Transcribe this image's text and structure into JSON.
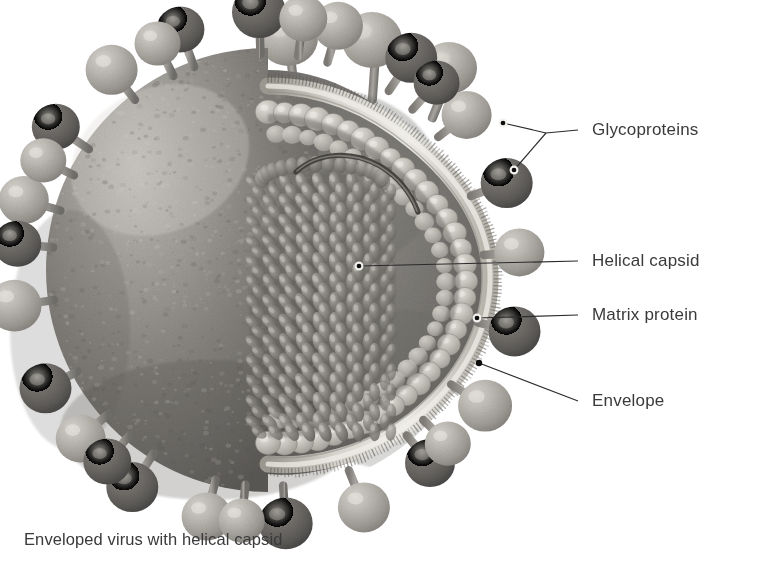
{
  "figure": {
    "kind": "scientific-illustration",
    "palette": {
      "background": "#ffffff",
      "text": "#3a3a3c",
      "leader_line": "#2b2b2d",
      "envelope_body_dark": "#6f6d6a",
      "envelope_body_mid": "#8d8a86",
      "envelope_body_light": "#b4b1ac",
      "membrane_light": "#cfccc6",
      "matrix_bead": "#c4c1bb",
      "spike_light": "#b9b6b0",
      "spike_dark": "#6a6864",
      "interior_cavity": "#7c7a76",
      "capsid_subunit": "#8a8782",
      "rna_strand": "#4d4b48"
    },
    "caption": "Enveloped virus with helical capsid",
    "labels": [
      {
        "id": "glycoproteins",
        "text": "Glycoproteins",
        "text_x": 592,
        "text_y": 135,
        "leader_type": "forked",
        "join_x": 546,
        "join_y": 133,
        "anchors": [
          {
            "x": 503,
            "y": 123,
            "style": "ring"
          },
          {
            "x": 514,
            "y": 170,
            "style": "ring"
          }
        ]
      },
      {
        "id": "helical-capsid",
        "text": "Helical capsid",
        "text_x": 592,
        "text_y": 266,
        "leader_type": "straight",
        "anchors": [
          {
            "x": 359,
            "y": 266,
            "style": "ring"
          }
        ]
      },
      {
        "id": "matrix-protein",
        "text": "Matrix protein",
        "text_x": 592,
        "text_y": 320,
        "leader_type": "straight",
        "anchors": [
          {
            "x": 477,
            "y": 318,
            "style": "ring"
          }
        ]
      },
      {
        "id": "envelope",
        "text": "Envelope",
        "text_x": 592,
        "text_y": 406,
        "leader_type": "straight",
        "anchors": [
          {
            "x": 479,
            "y": 363,
            "style": "dot"
          }
        ]
      }
    ],
    "structures": [
      {
        "id": "envelope-sphere",
        "name": "viral envelope outer surface",
        "note": "granular textured lipid membrane sphere, cut away on the right"
      },
      {
        "id": "glycoprotein-spikes",
        "name": "glycoprotein spikes",
        "note": "mushroom-shaped projections with round head on short stalk, radiating around the sphere",
        "count": 28
      },
      {
        "id": "lipid-bilayer",
        "name": "lipid bilayer rim",
        "note": "bristled double membrane revealed along the cut edge"
      },
      {
        "id": "matrix-layer",
        "name": "matrix protein layer",
        "note": "row of rounded beads lining the inner face of the envelope"
      },
      {
        "id": "helical-nucleocapsid",
        "name": "helical capsid",
        "note": "elongated cluster of teardrop capsomere subunits coiled around the nucleic acid"
      },
      {
        "id": "rna-strand",
        "name": "nucleic acid strand",
        "note": "curved filament emerging from the top of the nucleocapsid"
      }
    ]
  }
}
